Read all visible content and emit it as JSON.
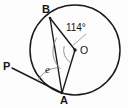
{
  "figure": {
    "background_color": "#fdfdfd",
    "line_color": "#1b1b1b",
    "arc_color": "#8d8d8d"
  },
  "circle": {
    "name": "circle-O",
    "center_label": "O",
    "center_x": 75,
    "center_y": 50,
    "radius": 45
  },
  "points": [
    {
      "name": "point-B",
      "label": "B",
      "x": 50,
      "y": 18,
      "on_circle": true
    },
    {
      "name": "point-A",
      "label": "A",
      "x": 62,
      "y": 93,
      "on_circle": true
    },
    {
      "name": "point-O",
      "label": "O",
      "x": 75,
      "y": 50,
      "on_circle": false
    },
    {
      "name": "point-P",
      "label": "P",
      "x": 12,
      "y": 68,
      "on_circle": false
    }
  ],
  "segments": [
    {
      "name": "segment-BO",
      "from": "B",
      "to": "O",
      "kind": "radius"
    },
    {
      "name": "segment-AO",
      "from": "A",
      "to": "O",
      "kind": "radius"
    },
    {
      "name": "segment-BA",
      "from": "B",
      "to": "A",
      "kind": "chord"
    },
    {
      "name": "segment-PA",
      "from": "P",
      "to": "A",
      "kind": "ray"
    }
  ],
  "angles": [
    {
      "name": "angle-BOA",
      "label": "114°",
      "value": 114,
      "unit": "degrees",
      "vertex": "O",
      "rays": [
        "B",
        "A"
      ],
      "marked_with_arc": true
    },
    {
      "name": "angle-PAB",
      "label": "e",
      "value": null,
      "unit": "variable",
      "vertex": "A",
      "rays": [
        "P",
        "B"
      ],
      "marked_with_arc": true
    }
  ],
  "labels": {
    "point_b": "B",
    "point_a": "A",
    "point_p": "P",
    "center_o": "O",
    "central_angle": "114°",
    "unknown_angle": "e"
  }
}
